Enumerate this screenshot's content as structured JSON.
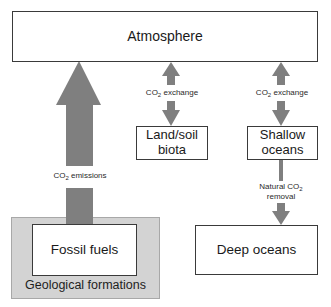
{
  "diagram": {
    "colors": {
      "arrow": "#7f7f7f",
      "box_border": "#3a3a3a",
      "geological_fill": "#d3d3d3"
    },
    "nodes": {
      "atmosphere": {
        "label": "Atmosphere"
      },
      "land_soil_biota": {
        "label": "Land/soil biota",
        "line1": "Land/soil",
        "line2": "biota"
      },
      "shallow_oceans": {
        "label": "Shallow oceans",
        "line1": "Shallow",
        "line2": "oceans"
      },
      "deep_oceans": {
        "label": "Deep oceans"
      },
      "fossil_fuels": {
        "label": "Fossil fuels"
      },
      "geological_formations": {
        "label": "Geological formations"
      }
    },
    "edges": [
      {
        "from": "fossil_fuels",
        "to": "atmosphere",
        "direction": "one-way",
        "label": "CO2 emissions",
        "label_prefix": "CO",
        "label_sub": "2",
        "label_suffix": " emissions"
      },
      {
        "from": "atmosphere",
        "to": "land_soil_biota",
        "direction": "two-way",
        "label": "CO2 exchange",
        "label_prefix": "CO",
        "label_sub": "2",
        "label_suffix": " exchange"
      },
      {
        "from": "atmosphere",
        "to": "shallow_oceans",
        "direction": "two-way",
        "label": "CO2 exchange",
        "label_prefix": "CO",
        "label_sub": "2",
        "label_suffix": " exchange"
      },
      {
        "from": "shallow_oceans",
        "to": "deep_oceans",
        "direction": "one-way",
        "label": "Natural CO2 removal",
        "label_line1_prefix": "Natural CO",
        "label_sub": "2",
        "label_line2": "removal"
      }
    ]
  }
}
